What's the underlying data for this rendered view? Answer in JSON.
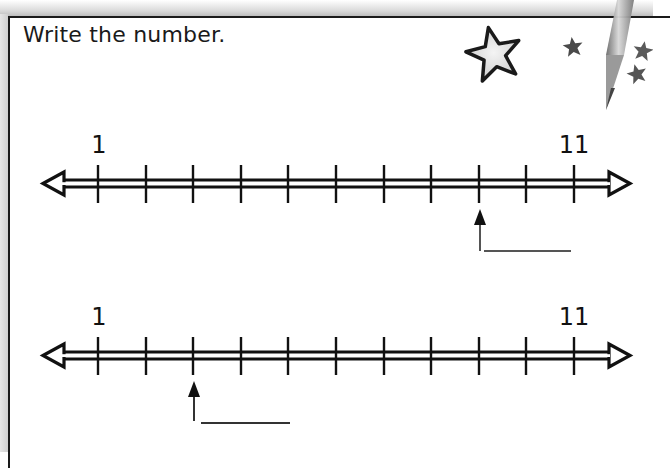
{
  "worksheet": {
    "instruction": "Write the number.",
    "problems": [
      {
        "id": 1,
        "start_label": "1",
        "end_label": "11",
        "tick_count": 11,
        "tick_values": [
          1,
          2,
          3,
          4,
          5,
          6,
          7,
          8,
          9,
          10,
          11
        ],
        "arrow_points_to_tick_index": 8,
        "answer_blank": ""
      },
      {
        "id": 2,
        "start_label": "1",
        "end_label": "11",
        "tick_count": 11,
        "tick_values": [
          1,
          2,
          3,
          4,
          5,
          6,
          7,
          8,
          9,
          10,
          11
        ],
        "arrow_points_to_tick_index": 2,
        "answer_blank": ""
      }
    ]
  },
  "decorations": {
    "icons": [
      "large-outline-star-icon",
      "small-star-icon",
      "small-star-icon",
      "small-star-icon",
      "pencil-icon"
    ]
  },
  "colors": {
    "ink": "#111111",
    "background": "#ffffff",
    "frame": "#1a1a1a",
    "star_fill": "#e9e9e9",
    "small_star": "#4a4a4a"
  }
}
